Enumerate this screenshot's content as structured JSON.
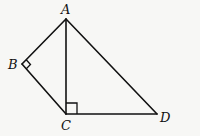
{
  "diagram": {
    "type": "geometry",
    "points": {
      "A": {
        "label": "A",
        "x": 66,
        "y": 19
      },
      "B": {
        "label": "B",
        "x": 22,
        "y": 64
      },
      "C": {
        "label": "C",
        "x": 66,
        "y": 114
      },
      "D": {
        "label": "D",
        "x": 157,
        "y": 114
      }
    },
    "segments": [
      "AB",
      "BC",
      "AC",
      "CD",
      "AD"
    ],
    "right_angles": [
      "ABC",
      "ACD"
    ],
    "colors": {
      "stroke": "#111111",
      "background": "#f7f7f5"
    }
  }
}
